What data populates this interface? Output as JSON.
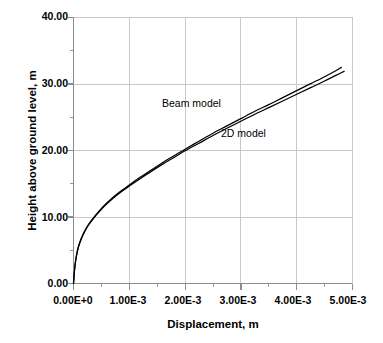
{
  "chart_data": {
    "type": "line",
    "title": "",
    "xlabel": "Displacement, m",
    "ylabel": "Height above ground level, m",
    "xlim": [
      0,
      0.005
    ],
    "ylim": [
      0,
      40
    ],
    "xticks": [
      0,
      0.001,
      0.002,
      0.003,
      0.004,
      0.005
    ],
    "xticklabels": [
      "0.00E+0",
      "1.00E-3",
      "2.00E-3",
      "3.00E-3",
      "4.00E-3",
      "5.00E-3"
    ],
    "yticks": [
      0,
      10,
      20,
      30,
      40
    ],
    "yticklabels": [
      "0.00",
      "10.00",
      "20.00",
      "30.00",
      "40.00"
    ],
    "xminor_ticks": [
      0.0005,
      0.0015,
      0.0025,
      0.0035,
      0.0045
    ],
    "yminor_ticks": [
      5,
      15,
      25,
      35
    ],
    "grid": true,
    "grid_color": "#c8c8c8",
    "legend_position": "inline-annotation",
    "line_color": "#000000",
    "background": "#ffffff",
    "series": [
      {
        "name": "Beam model",
        "annotation": "Beam model",
        "x": [
          0.0,
          2e-05,
          5e-05,
          9e-05,
          0.00014,
          0.0002,
          0.00027,
          0.00035,
          0.00045,
          0.00056,
          0.0007,
          0.00085,
          0.001,
          0.0012,
          0.0014,
          0.0016,
          0.0018,
          0.002,
          0.00225,
          0.0025,
          0.00275,
          0.003,
          0.00325,
          0.0035,
          0.00375,
          0.004,
          0.00425,
          0.0045,
          0.0047,
          0.0048
        ],
        "y": [
          0.0,
          2.2,
          4.1,
          5.6,
          6.8,
          7.9,
          8.9,
          9.8,
          10.8,
          11.8,
          12.9,
          13.9,
          14.8,
          16.0,
          17.1,
          18.2,
          19.2,
          20.2,
          21.4,
          22.6,
          23.7,
          24.8,
          25.9,
          26.9,
          27.95,
          29.0,
          30.05,
          31.1,
          32.0,
          32.5
        ]
      },
      {
        "name": "2D model",
        "annotation": "2D model",
        "x": [
          0.0,
          2e-05,
          5e-05,
          9e-05,
          0.00014,
          0.0002,
          0.00027,
          0.00035,
          0.00045,
          0.00056,
          0.0007,
          0.00085,
          0.001,
          0.0012,
          0.0014,
          0.0016,
          0.0018,
          0.002,
          0.00225,
          0.0025,
          0.00275,
          0.003,
          0.00325,
          0.0035,
          0.00375,
          0.004,
          0.00425,
          0.0045,
          0.0047,
          0.00485
        ],
        "y": [
          0.0,
          2.15,
          4.0,
          5.5,
          6.7,
          7.8,
          8.8,
          9.7,
          10.7,
          11.7,
          12.75,
          13.75,
          14.65,
          15.8,
          16.9,
          17.95,
          18.95,
          19.95,
          21.1,
          22.25,
          23.35,
          24.4,
          25.45,
          26.45,
          27.45,
          28.45,
          29.45,
          30.45,
          31.3,
          31.9
        ]
      }
    ]
  },
  "axes": {
    "x_title": "Displacement, m",
    "y_title": "Height above ground level, m",
    "x_tick_labels": [
      "0.00E+0",
      "1.00E-3",
      "2.00E-3",
      "3.00E-3",
      "4.00E-3",
      "5.00E-3"
    ],
    "y_tick_labels": [
      "40.00",
      "30.00",
      "20.00",
      "10.00",
      "0.00"
    ]
  },
  "annotations": {
    "beam_model": "Beam model",
    "two_d_model": "2D model"
  },
  "caption": ""
}
